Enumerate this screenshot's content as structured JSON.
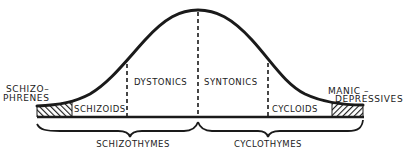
{
  "diagram": {
    "type": "normal-distribution-curve",
    "regions": {
      "schizophrenes": {
        "line1": "SCHIZO–",
        "line2": "PHRENES"
      },
      "schizoids": "SCHIZOIDS",
      "dystonics": "DYSTONICS",
      "syntonics": "SYNTONICS",
      "cycloids": "CYCLOIDS",
      "manic_depressives": {
        "line1": "MANIC –",
        "line2": "DEPRESSIVES"
      }
    },
    "groups": {
      "left": "SCHIZOTHYMES",
      "right": "CYCLOTHYMES"
    },
    "colors": {
      "ink": "#1a1a1a",
      "background": "#ffffff"
    }
  }
}
